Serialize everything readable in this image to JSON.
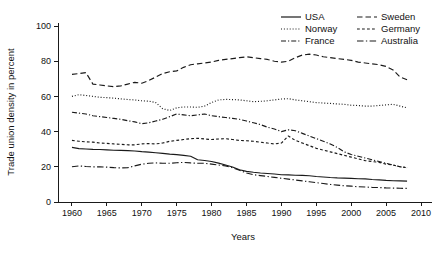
{
  "chart_data": {
    "type": "line",
    "title": "",
    "xlabel": "Years",
    "ylabel": "Trade union density in percent",
    "xlim": [
      1958,
      2011
    ],
    "ylim": [
      0,
      100
    ],
    "grid": false,
    "legend_position": "top-right",
    "xticks": [
      1960,
      1965,
      1970,
      1975,
      1980,
      1985,
      1990,
      1995,
      2000,
      2005,
      2010
    ],
    "yticks": [
      0,
      20,
      40,
      60,
      80,
      100
    ],
    "series": [
      {
        "name": "USA",
        "style": "solid",
        "x": [
          1960,
          1961,
          1962,
          1963,
          1964,
          1965,
          1966,
          1967,
          1968,
          1969,
          1970,
          1971,
          1972,
          1973,
          1974,
          1975,
          1976,
          1977,
          1978,
          1979,
          1980,
          1981,
          1982,
          1983,
          1984,
          1985,
          1986,
          1987,
          1988,
          1989,
          1990,
          1991,
          1992,
          1993,
          1994,
          1995,
          1996,
          1997,
          1998,
          1999,
          2000,
          2001,
          2002,
          2003,
          2004,
          2005,
          2006,
          2007,
          2008
        ],
        "values": [
          31.0,
          30.3,
          30.1,
          29.9,
          29.8,
          29.6,
          29.4,
          29.3,
          29.2,
          29.0,
          28.6,
          28.3,
          28.0,
          27.6,
          27.2,
          26.9,
          26.5,
          26.0,
          24.0,
          23.6,
          23.0,
          22.1,
          21.0,
          19.9,
          18.3,
          17.4,
          16.9,
          16.5,
          16.2,
          15.9,
          15.5,
          15.4,
          15.2,
          15.1,
          14.9,
          14.5,
          14.2,
          13.9,
          13.7,
          13.6,
          13.4,
          13.2,
          13.1,
          12.8,
          12.6,
          12.3,
          12.1,
          12.0,
          11.9
        ]
      },
      {
        "name": "Norway",
        "style": "dotted",
        "x": [
          1960,
          1961,
          1962,
          1963,
          1964,
          1965,
          1966,
          1967,
          1968,
          1969,
          1970,
          1971,
          1972,
          1973,
          1974,
          1975,
          1976,
          1977,
          1978,
          1979,
          1980,
          1981,
          1982,
          1983,
          1984,
          1985,
          1986,
          1987,
          1988,
          1989,
          1990,
          1991,
          1992,
          1993,
          1994,
          1995,
          1996,
          1997,
          1998,
          1999,
          2000,
          2001,
          2002,
          2003,
          2004,
          2005,
          2006,
          2007,
          2008
        ],
        "values": [
          60.0,
          61.0,
          60.5,
          60.0,
          59.5,
          59.3,
          59.0,
          58.6,
          58.2,
          58.0,
          57.5,
          57.3,
          56.5,
          53.0,
          52.0,
          53.5,
          54.0,
          54.0,
          53.8,
          54.5,
          56.5,
          58.0,
          58.3,
          58.2,
          58.0,
          57.5,
          57.0,
          57.2,
          57.5,
          58.0,
          58.5,
          58.7,
          58.0,
          57.5,
          57.0,
          56.5,
          56.2,
          56.0,
          55.7,
          55.5,
          55.0,
          54.8,
          54.5,
          54.5,
          54.8,
          55.2,
          55.5,
          54.5,
          53.5
        ]
      },
      {
        "name": "France",
        "style": "dashdot",
        "x": [
          1960,
          1961,
          1962,
          1963,
          1964,
          1965,
          1966,
          1967,
          1968,
          1969,
          1970,
          1971,
          1972,
          1973,
          1974,
          1975,
          1976,
          1977,
          1978,
          1979,
          1980,
          1981,
          1982,
          1983,
          1984,
          1985,
          1986,
          1987,
          1988,
          1989,
          1990,
          1991,
          1992,
          1993,
          1994,
          1995,
          1996,
          1997,
          1998,
          1999,
          2000,
          2001,
          2002,
          2003,
          2004,
          2005,
          2006,
          2007,
          2008
        ],
        "values": [
          51.0,
          50.5,
          50.0,
          49.0,
          48.5,
          48.0,
          47.5,
          47.0,
          46.2,
          45.5,
          44.5,
          45.0,
          46.0,
          47.0,
          48.5,
          50.0,
          49.5,
          49.0,
          49.5,
          50.0,
          49.0,
          48.5,
          48.0,
          47.5,
          47.0,
          46.0,
          45.0,
          44.0,
          42.5,
          41.5,
          40.0,
          41.0,
          40.5,
          39.0,
          37.5,
          36.0,
          34.5,
          33.0,
          31.0,
          28.5,
          27.0,
          26.0,
          25.0,
          24.0,
          23.0,
          22.0,
          21.0,
          20.0,
          19.5
        ]
      },
      {
        "name": "Sweden",
        "style": "dashed",
        "x": [
          1960,
          1961,
          1962,
          1963,
          1964,
          1965,
          1966,
          1967,
          1968,
          1969,
          1970,
          1971,
          1972,
          1973,
          1974,
          1975,
          1976,
          1977,
          1978,
          1979,
          1980,
          1981,
          1982,
          1983,
          1984,
          1985,
          1986,
          1987,
          1988,
          1989,
          1990,
          1991,
          1992,
          1993,
          1994,
          1995,
          1996,
          1997,
          1998,
          1999,
          2000,
          2001,
          2002,
          2003,
          2004,
          2005,
          2006,
          2007,
          2008
        ],
        "values": [
          72.5,
          73.0,
          73.5,
          67.0,
          66.5,
          66.0,
          65.5,
          66.0,
          67.0,
          68.0,
          67.5,
          69.0,
          71.0,
          73.0,
          74.0,
          74.5,
          76.5,
          78.0,
          78.5,
          79.0,
          79.5,
          80.5,
          81.0,
          81.5,
          82.0,
          82.5,
          82.0,
          81.5,
          81.0,
          80.0,
          79.5,
          80.0,
          82.0,
          83.5,
          84.0,
          83.5,
          82.5,
          82.0,
          81.5,
          81.0,
          80.5,
          79.5,
          79.0,
          78.5,
          78.0,
          77.0,
          75.0,
          71.0,
          69.5
        ]
      },
      {
        "name": "Germany",
        "style": "shortdash",
        "x": [
          1960,
          1961,
          1962,
          1963,
          1964,
          1965,
          1966,
          1967,
          1968,
          1969,
          1970,
          1971,
          1972,
          1973,
          1974,
          1975,
          1976,
          1977,
          1978,
          1979,
          1980,
          1981,
          1982,
          1983,
          1984,
          1985,
          1986,
          1987,
          1988,
          1989,
          1990,
          1991,
          1992,
          1993,
          1994,
          1995,
          1996,
          1997,
          1998,
          1999,
          2000,
          2001,
          2002,
          2003,
          2004,
          2005,
          2006,
          2007,
          2008
        ],
        "values": [
          35.0,
          34.5,
          34.2,
          34.0,
          33.5,
          33.3,
          33.0,
          32.8,
          32.5,
          32.5,
          33.0,
          33.2,
          33.0,
          33.5,
          34.5,
          35.0,
          35.5,
          36.0,
          36.2,
          35.8,
          35.5,
          35.8,
          36.0,
          35.5,
          35.0,
          34.8,
          34.5,
          34.0,
          33.5,
          33.0,
          33.5,
          37.5,
          35.0,
          33.5,
          32.0,
          30.5,
          29.5,
          28.5,
          27.5,
          26.5,
          25.5,
          24.5,
          23.5,
          23.0,
          22.5,
          21.5,
          21.0,
          20.0,
          19.5
        ]
      },
      {
        "name": "Australia",
        "style": "dashdotlong",
        "x": [
          1960,
          1961,
          1962,
          1963,
          1964,
          1965,
          1966,
          1967,
          1968,
          1969,
          1970,
          1971,
          1972,
          1973,
          1974,
          1975,
          1976,
          1977,
          1978,
          1979,
          1980,
          1981,
          1982,
          1983,
          1984,
          1985,
          1986,
          1987,
          1988,
          1989,
          1990,
          1991,
          1992,
          1993,
          1994,
          1995,
          1996,
          1997,
          1998,
          1999,
          2000,
          2001,
          2002,
          2003,
          2004,
          2005,
          2006,
          2007,
          2008
        ],
        "values": [
          20.0,
          20.5,
          20.2,
          20.0,
          20.0,
          19.8,
          19.5,
          19.4,
          19.5,
          20.5,
          21.5,
          22.0,
          22.2,
          22.0,
          22.0,
          22.3,
          22.5,
          22.2,
          22.0,
          22.0,
          21.5,
          21.0,
          20.5,
          19.5,
          18.0,
          16.5,
          15.5,
          15.0,
          14.5,
          14.0,
          13.5,
          13.0,
          12.5,
          12.0,
          11.5,
          11.0,
          10.5,
          10.0,
          9.6,
          9.2,
          9.0,
          8.7,
          8.5,
          8.3,
          8.2,
          8.0,
          7.9,
          7.8,
          7.7
        ]
      }
    ]
  },
  "legend": {
    "entries": [
      {
        "label": "USA",
        "style": "solid"
      },
      {
        "label": "Sweden",
        "style": "dashed"
      },
      {
        "label": "Norway",
        "style": "dotted"
      },
      {
        "label": "Germany",
        "style": "shortdash"
      },
      {
        "label": "France",
        "style": "dashdot"
      },
      {
        "label": "Australia",
        "style": "dashdotlong"
      }
    ]
  }
}
